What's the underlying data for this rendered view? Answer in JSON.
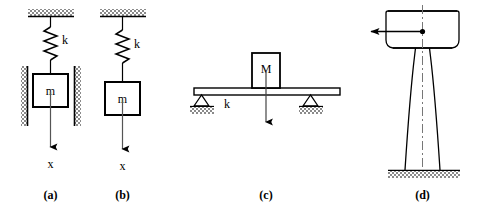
{
  "figure": {
    "background_color": "#ffffff",
    "line_color": "#000000",
    "hatch_color": "#808080",
    "width": 489,
    "height": 215
  },
  "panels": [
    {
      "id": "a",
      "caption": "(a)",
      "description": "Spring-mass system with guide walls",
      "labels": {
        "spring": "k",
        "mass": "m",
        "displacement": "x"
      },
      "elements": [
        "ceiling-hatch",
        "spring",
        "mass-block",
        "left-guide-wall",
        "right-guide-wall",
        "displacement-arrow"
      ]
    },
    {
      "id": "b",
      "caption": "(b)",
      "description": "Spring-mass system without guide walls",
      "labels": {
        "spring": "k",
        "mass": "m",
        "displacement": "x"
      },
      "elements": [
        "ceiling-hatch",
        "spring",
        "mass-block",
        "displacement-arrow"
      ]
    },
    {
      "id": "c",
      "caption": "(c)",
      "description": "Simply supported beam carrying a central mass",
      "labels": {
        "mass": "M",
        "stiffness": "k"
      },
      "elements": [
        "beam",
        "mass-block",
        "load-arrow",
        "left-pin-support",
        "right-pin-support",
        "ground-hatch-left",
        "ground-hatch-right"
      ]
    },
    {
      "id": "d",
      "caption": "(d)",
      "description": "Elevated water tower on tapered legs with lateral load",
      "labels": {},
      "elements": [
        "tank",
        "tapered-legs",
        "ground-hatch",
        "centerline",
        "center-node",
        "lateral-force-arrow"
      ]
    }
  ]
}
